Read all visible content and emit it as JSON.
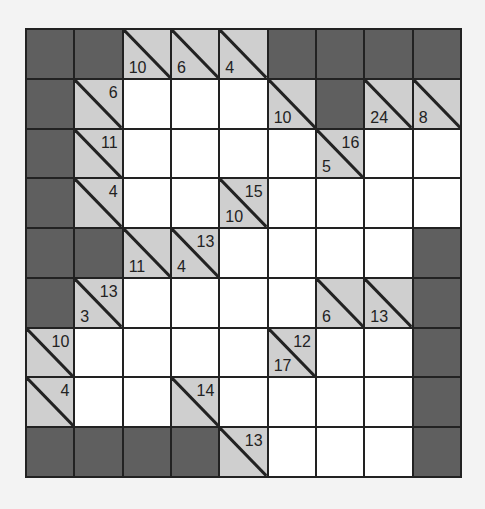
{
  "puzzle": {
    "type": "kakuro",
    "rows": 9,
    "cols": 9,
    "colors": {
      "blocked": "#5f5f5f",
      "clue": "#cfcfcf",
      "white": "#ffffff",
      "grid_line": "#222222"
    },
    "grid": [
      [
        {
          "t": "D"
        },
        {
          "t": "D"
        },
        {
          "t": "C",
          "down": "10"
        },
        {
          "t": "C",
          "down": "6"
        },
        {
          "t": "C",
          "down": "4"
        },
        {
          "t": "D"
        },
        {
          "t": "D"
        },
        {
          "t": "D"
        },
        {
          "t": "D"
        }
      ],
      [
        {
          "t": "D"
        },
        {
          "t": "C",
          "right": "6"
        },
        {
          "t": "W"
        },
        {
          "t": "W"
        },
        {
          "t": "W"
        },
        {
          "t": "C",
          "down": "10"
        },
        {
          "t": "D"
        },
        {
          "t": "C",
          "down": "24"
        },
        {
          "t": "C",
          "down": "8"
        }
      ],
      [
        {
          "t": "D"
        },
        {
          "t": "C",
          "right": "11"
        },
        {
          "t": "W"
        },
        {
          "t": "W"
        },
        {
          "t": "W"
        },
        {
          "t": "W"
        },
        {
          "t": "C",
          "down": "5",
          "right": "16"
        },
        {
          "t": "W"
        },
        {
          "t": "W"
        }
      ],
      [
        {
          "t": "D"
        },
        {
          "t": "C",
          "right": "4"
        },
        {
          "t": "W"
        },
        {
          "t": "W"
        },
        {
          "t": "C",
          "down": "10",
          "right": "15"
        },
        {
          "t": "W"
        },
        {
          "t": "W"
        },
        {
          "t": "W"
        },
        {
          "t": "W"
        }
      ],
      [
        {
          "t": "D"
        },
        {
          "t": "D"
        },
        {
          "t": "C",
          "down": "11"
        },
        {
          "t": "C",
          "down": "4",
          "right": "13"
        },
        {
          "t": "W"
        },
        {
          "t": "W"
        },
        {
          "t": "W"
        },
        {
          "t": "W"
        },
        {
          "t": "D"
        }
      ],
      [
        {
          "t": "D"
        },
        {
          "t": "C",
          "down": "3",
          "right": "13"
        },
        {
          "t": "W"
        },
        {
          "t": "W"
        },
        {
          "t": "W"
        },
        {
          "t": "W"
        },
        {
          "t": "C",
          "down": "6"
        },
        {
          "t": "C",
          "down": "13"
        },
        {
          "t": "D"
        }
      ],
      [
        {
          "t": "C",
          "right": "10"
        },
        {
          "t": "W"
        },
        {
          "t": "W"
        },
        {
          "t": "W"
        },
        {
          "t": "W"
        },
        {
          "t": "C",
          "down": "17",
          "right": "12"
        },
        {
          "t": "W"
        },
        {
          "t": "W"
        },
        {
          "t": "D"
        }
      ],
      [
        {
          "t": "C",
          "right": "4"
        },
        {
          "t": "W"
        },
        {
          "t": "W"
        },
        {
          "t": "C",
          "right": "14"
        },
        {
          "t": "W"
        },
        {
          "t": "W"
        },
        {
          "t": "W"
        },
        {
          "t": "W"
        },
        {
          "t": "D"
        }
      ],
      [
        {
          "t": "D"
        },
        {
          "t": "D"
        },
        {
          "t": "D"
        },
        {
          "t": "D"
        },
        {
          "t": "C",
          "right": "13"
        },
        {
          "t": "W"
        },
        {
          "t": "W"
        },
        {
          "t": "W"
        },
        {
          "t": "D"
        }
      ]
    ]
  }
}
